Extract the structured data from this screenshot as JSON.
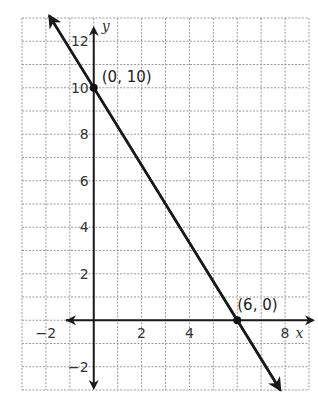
{
  "chart_data": {
    "type": "line",
    "title": "",
    "xlabel": "x",
    "ylabel": "y",
    "xlim": [
      -3,
      9
    ],
    "ylim": [
      -3,
      13
    ],
    "grid": true,
    "grid_style": "dashed",
    "x_ticks": [
      -2,
      2,
      4,
      8
    ],
    "y_ticks": [
      12,
      10,
      8,
      6,
      4,
      2,
      -2
    ],
    "x_tick_labels": [
      "−2",
      "2",
      "4",
      "8"
    ],
    "y_tick_labels": [
      "12",
      "10",
      "8",
      "6",
      "4",
      "2",
      "−2"
    ],
    "series": [
      {
        "name": "line",
        "equation": "y = -5/3 x + 10",
        "x": [
          0,
          6
        ],
        "y": [
          10,
          0
        ],
        "arrows": "both"
      }
    ],
    "points": [
      {
        "x": 0,
        "y": 10,
        "label": "(0, 10)"
      },
      {
        "x": 6,
        "y": 0,
        "label": "(6, 0)"
      }
    ],
    "annotations": [
      "(0, 10)",
      "(6, 0)"
    ],
    "legend": null,
    "colors": {
      "line": "#1a1a1a",
      "grid": "#9a9a9a",
      "axis": "#1a1a1a"
    }
  }
}
